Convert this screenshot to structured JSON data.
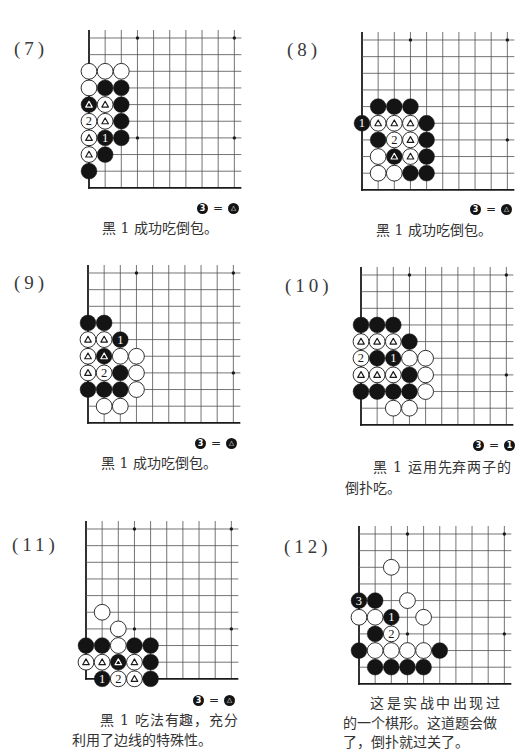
{
  "page": {
    "problems": [
      {
        "label": "(7)",
        "hoshi": [
          [
            3,
            0
          ],
          [
            9,
            0
          ],
          [
            3,
            6
          ],
          [
            9,
            6
          ]
        ],
        "stones": [
          {
            "c": 0,
            "r": 2,
            "color": "white"
          },
          {
            "c": 1,
            "r": 2,
            "color": "white"
          },
          {
            "c": 2,
            "r": 2,
            "color": "white"
          },
          {
            "c": 0,
            "r": 3,
            "color": "white"
          },
          {
            "c": 1,
            "r": 3,
            "color": "black"
          },
          {
            "c": 2,
            "r": 3,
            "color": "black"
          },
          {
            "c": 0,
            "r": 4,
            "color": "black",
            "mark": "triangle"
          },
          {
            "c": 1,
            "r": 4,
            "color": "white",
            "mark": "triangle"
          },
          {
            "c": 2,
            "r": 4,
            "color": "black"
          },
          {
            "c": 0,
            "r": 5,
            "color": "white",
            "mark": "2"
          },
          {
            "c": 1,
            "r": 5,
            "color": "white",
            "mark": "triangle"
          },
          {
            "c": 2,
            "r": 5,
            "color": "black"
          },
          {
            "c": 0,
            "r": 6,
            "color": "white",
            "mark": "triangle"
          },
          {
            "c": 1,
            "r": 6,
            "color": "black",
            "mark": "1"
          },
          {
            "c": 2,
            "r": 6,
            "color": "black"
          },
          {
            "c": 0,
            "r": 7,
            "color": "white",
            "mark": "triangle"
          },
          {
            "c": 1,
            "r": 7,
            "color": "black"
          },
          {
            "c": 0,
            "r": 8,
            "color": "black"
          }
        ],
        "equation": {
          "left": {
            "stone": "black",
            "text": "3"
          },
          "sign": "=",
          "right": {
            "stone": "black",
            "text": "△"
          }
        },
        "caption": [
          "黑 1 成功吃倒包。"
        ]
      },
      {
        "label": "(8)",
        "hoshi": [
          [
            3,
            0
          ],
          [
            9,
            0
          ],
          [
            3,
            6
          ],
          [
            9,
            6
          ]
        ],
        "stones": [
          {
            "c": 1,
            "r": 4,
            "color": "black"
          },
          {
            "c": 2,
            "r": 4,
            "color": "black"
          },
          {
            "c": 3,
            "r": 4,
            "color": "black"
          },
          {
            "c": 0,
            "r": 5,
            "color": "black",
            "mark": "1"
          },
          {
            "c": 1,
            "r": 5,
            "color": "white",
            "mark": "triangle"
          },
          {
            "c": 2,
            "r": 5,
            "color": "white",
            "mark": "triangle"
          },
          {
            "c": 3,
            "r": 5,
            "color": "white",
            "mark": "triangle"
          },
          {
            "c": 4,
            "r": 5,
            "color": "black"
          },
          {
            "c": 1,
            "r": 6,
            "color": "black"
          },
          {
            "c": 2,
            "r": 6,
            "color": "white",
            "mark": "2"
          },
          {
            "c": 3,
            "r": 6,
            "color": "white",
            "mark": "triangle"
          },
          {
            "c": 4,
            "r": 6,
            "color": "black"
          },
          {
            "c": 1,
            "r": 7,
            "color": "white"
          },
          {
            "c": 2,
            "r": 7,
            "color": "black",
            "mark": "triangle"
          },
          {
            "c": 3,
            "r": 7,
            "color": "white",
            "mark": "triangle"
          },
          {
            "c": 4,
            "r": 7,
            "color": "black"
          },
          {
            "c": 1,
            "r": 8,
            "color": "white"
          },
          {
            "c": 2,
            "r": 8,
            "color": "white"
          },
          {
            "c": 3,
            "r": 8,
            "color": "black"
          },
          {
            "c": 4,
            "r": 8,
            "color": "black"
          }
        ],
        "equation": {
          "left": {
            "stone": "black",
            "text": "3"
          },
          "sign": "=",
          "right": {
            "stone": "black",
            "text": "△"
          }
        },
        "caption": [
          "黑 1 成功吃倒包。"
        ]
      },
      {
        "label": "(9)",
        "hoshi": [
          [
            3,
            0
          ],
          [
            9,
            0
          ],
          [
            3,
            6
          ],
          [
            9,
            6
          ]
        ],
        "stones": [
          {
            "c": 0,
            "r": 3,
            "color": "black"
          },
          {
            "c": 1,
            "r": 3,
            "color": "black"
          },
          {
            "c": 0,
            "r": 4,
            "color": "white",
            "mark": "triangle"
          },
          {
            "c": 1,
            "r": 4,
            "color": "white",
            "mark": "triangle"
          },
          {
            "c": 2,
            "r": 4,
            "color": "black",
            "mark": "1"
          },
          {
            "c": 0,
            "r": 5,
            "color": "white",
            "mark": "triangle"
          },
          {
            "c": 1,
            "r": 5,
            "color": "black",
            "mark": "triangle"
          },
          {
            "c": 2,
            "r": 5,
            "color": "white"
          },
          {
            "c": 3,
            "r": 5,
            "color": "white"
          },
          {
            "c": 0,
            "r": 6,
            "color": "white",
            "mark": "triangle"
          },
          {
            "c": 1,
            "r": 6,
            "color": "white",
            "mark": "2"
          },
          {
            "c": 2,
            "r": 6,
            "color": "black"
          },
          {
            "c": 3,
            "r": 6,
            "color": "white"
          },
          {
            "c": 0,
            "r": 7,
            "color": "black"
          },
          {
            "c": 1,
            "r": 7,
            "color": "black"
          },
          {
            "c": 2,
            "r": 7,
            "color": "black"
          },
          {
            "c": 3,
            "r": 7,
            "color": "white"
          },
          {
            "c": 1,
            "r": 8,
            "color": "white"
          },
          {
            "c": 2,
            "r": 8,
            "color": "white"
          }
        ],
        "equation": {
          "left": {
            "stone": "black",
            "text": "3"
          },
          "sign": "=",
          "right": {
            "stone": "black",
            "text": "△"
          }
        },
        "caption": [
          "黑 1 成功吃倒包。"
        ]
      },
      {
        "label": "(10)",
        "hoshi": [
          [
            3,
            0
          ],
          [
            9,
            0
          ],
          [
            3,
            6
          ],
          [
            9,
            6
          ]
        ],
        "stones": [
          {
            "c": 0,
            "r": 3,
            "color": "black"
          },
          {
            "c": 1,
            "r": 3,
            "color": "black"
          },
          {
            "c": 2,
            "r": 3,
            "color": "black"
          },
          {
            "c": 0,
            "r": 4,
            "color": "white",
            "mark": "triangle"
          },
          {
            "c": 1,
            "r": 4,
            "color": "white",
            "mark": "triangle"
          },
          {
            "c": 2,
            "r": 4,
            "color": "white",
            "mark": "triangle"
          },
          {
            "c": 3,
            "r": 4,
            "color": "black"
          },
          {
            "c": 0,
            "r": 5,
            "color": "white",
            "mark": "2"
          },
          {
            "c": 1,
            "r": 5,
            "color": "black"
          },
          {
            "c": 2,
            "r": 5,
            "color": "black",
            "mark": "1"
          },
          {
            "c": 3,
            "r": 5,
            "color": "white"
          },
          {
            "c": 4,
            "r": 5,
            "color": "white"
          },
          {
            "c": 0,
            "r": 6,
            "color": "white",
            "mark": "triangle"
          },
          {
            "c": 1,
            "r": 6,
            "color": "white",
            "mark": "triangle"
          },
          {
            "c": 2,
            "r": 6,
            "color": "white",
            "mark": "triangle"
          },
          {
            "c": 3,
            "r": 6,
            "color": "black"
          },
          {
            "c": 4,
            "r": 6,
            "color": "white"
          },
          {
            "c": 0,
            "r": 7,
            "color": "black"
          },
          {
            "c": 1,
            "r": 7,
            "color": "black"
          },
          {
            "c": 2,
            "r": 7,
            "color": "black"
          },
          {
            "c": 3,
            "r": 7,
            "color": "black"
          },
          {
            "c": 4,
            "r": 7,
            "color": "white"
          },
          {
            "c": 2,
            "r": 8,
            "color": "white"
          },
          {
            "c": 3,
            "r": 8,
            "color": "white"
          }
        ],
        "equation": {
          "left": {
            "stone": "black",
            "text": "3"
          },
          "sign": "=",
          "right": {
            "stone": "black",
            "text": "1"
          }
        },
        "caption": [
          "黑 1 运用先弃两子的",
          "倒扑吃。"
        ]
      },
      {
        "label": "(11)",
        "hoshi": [
          [
            3,
            0
          ],
          [
            9,
            0
          ],
          [
            3,
            6
          ],
          [
            9,
            6
          ]
        ],
        "stones": [
          {
            "c": 1,
            "r": 5,
            "color": "white"
          },
          {
            "c": 2,
            "r": 6,
            "color": "white"
          },
          {
            "c": 0,
            "r": 7,
            "color": "black"
          },
          {
            "c": 1,
            "r": 7,
            "color": "black"
          },
          {
            "c": 2,
            "r": 7,
            "color": "white"
          },
          {
            "c": 3,
            "r": 7,
            "color": "black"
          },
          {
            "c": 4,
            "r": 7,
            "color": "black"
          },
          {
            "c": 0,
            "r": 8,
            "color": "white",
            "mark": "triangle"
          },
          {
            "c": 1,
            "r": 8,
            "color": "white",
            "mark": "triangle"
          },
          {
            "c": 2,
            "r": 8,
            "color": "black",
            "mark": "triangle"
          },
          {
            "c": 3,
            "r": 8,
            "color": "white",
            "mark": "triangle"
          },
          {
            "c": 4,
            "r": 8,
            "color": "black"
          },
          {
            "c": 1,
            "r": 9,
            "color": "black",
            "mark": "1"
          },
          {
            "c": 2,
            "r": 9,
            "color": "white",
            "mark": "2"
          },
          {
            "c": 3,
            "r": 9,
            "color": "white",
            "mark": "triangle"
          },
          {
            "c": 4,
            "r": 9,
            "color": "black"
          }
        ],
        "equation": {
          "left": {
            "stone": "black",
            "text": "3"
          },
          "sign": "=",
          "right": {
            "stone": "black",
            "text": "△"
          }
        },
        "caption": [
          "黑 1 吃法有趣，充分",
          "利用了边线的特殊性。"
        ]
      },
      {
        "label": "(12)",
        "hoshi": [
          [
            3,
            0
          ],
          [
            9,
            0
          ],
          [
            3,
            6
          ],
          [
            9,
            6
          ]
        ],
        "stones": [
          {
            "c": 2,
            "r": 2,
            "color": "white"
          },
          {
            "c": 0,
            "r": 4,
            "color": "black",
            "mark": "3"
          },
          {
            "c": 1,
            "r": 4,
            "color": "black"
          },
          {
            "c": 3,
            "r": 4,
            "color": "white"
          },
          {
            "c": 0,
            "r": 5,
            "color": "white"
          },
          {
            "c": 1,
            "r": 5,
            "color": "white"
          },
          {
            "c": 2,
            "r": 5,
            "color": "black",
            "mark": "1"
          },
          {
            "c": 4,
            "r": 5,
            "color": "white"
          },
          {
            "c": 1,
            "r": 6,
            "color": "black"
          },
          {
            "c": 2,
            "r": 6,
            "color": "white",
            "mark": "2"
          },
          {
            "c": 0,
            "r": 7,
            "color": "black"
          },
          {
            "c": 1,
            "r": 7,
            "color": "white"
          },
          {
            "c": 2,
            "r": 7,
            "color": "white"
          },
          {
            "c": 3,
            "r": 7,
            "color": "white"
          },
          {
            "c": 4,
            "r": 7,
            "color": "white"
          },
          {
            "c": 5,
            "r": 7,
            "color": "black"
          },
          {
            "c": 1,
            "r": 8,
            "color": "black"
          },
          {
            "c": 2,
            "r": 8,
            "color": "black"
          },
          {
            "c": 3,
            "r": 8,
            "color": "black"
          },
          {
            "c": 4,
            "r": 8,
            "color": "black"
          }
        ],
        "caption": [
          "这是实战中出现过",
          "的一个棋形。这道题会做",
          "了，倒扑就过关了。"
        ]
      }
    ]
  }
}
